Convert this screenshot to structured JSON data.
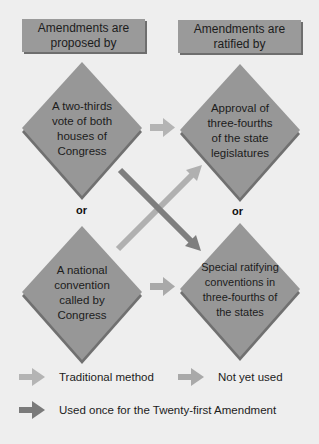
{
  "colors": {
    "background": "#eeeeee",
    "box": "#9a9a9a",
    "box_shadow": "#6e6e6e",
    "diamond": "#979797",
    "diamond_shadow": "#707070",
    "arrow_traditional": "#b4b4b4",
    "arrow_not_yet_used": "#a9a9a9",
    "arrow_used_once": "#7a7a7a"
  },
  "headers": {
    "proposed": "Amendments are\nproposed by",
    "ratified": "Amendments are\nratified by"
  },
  "diamonds": {
    "proposal_congress": "A two-thirds\nvote of both\nhouses of\nCongress",
    "ratify_legislatures": "Approval of\nthree-fourths\nof the state\nlegislatures",
    "proposal_convention": "A national\nconvention\ncalled by\nCongress",
    "ratify_conventions": "Special ratifying\nconventions in\nthree-fourths of\nthe states"
  },
  "connectors": {
    "left_or": "or",
    "right_or": "or"
  },
  "legend": {
    "traditional": "Traditional method",
    "not_yet_used": "Not yet used",
    "used_once": "Used once for the Twenty-first Amendment"
  }
}
